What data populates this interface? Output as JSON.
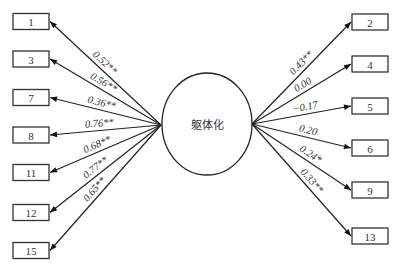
{
  "diagram": {
    "type": "path-diagram",
    "latent": {
      "id": "latent",
      "label": "躯体化"
    },
    "left_items": [
      {
        "id": "1",
        "label": "1",
        "coefficient": "0.52**"
      },
      {
        "id": "3",
        "label": "3",
        "coefficient": "0.56**"
      },
      {
        "id": "7",
        "label": "7",
        "coefficient": "0.36**"
      },
      {
        "id": "8",
        "label": "8",
        "coefficient": "0.76**"
      },
      {
        "id": "11",
        "label": "11",
        "coefficient": "0.68**"
      },
      {
        "id": "12",
        "label": "12",
        "coefficient": "0.77**"
      },
      {
        "id": "15",
        "label": "15",
        "coefficient": "0.65**"
      }
    ],
    "right_items": [
      {
        "id": "2",
        "label": "2",
        "coefficient": "0.43**"
      },
      {
        "id": "4",
        "label": "4",
        "coefficient": "0.00"
      },
      {
        "id": "5",
        "label": "5",
        "coefficient": "−0.17"
      },
      {
        "id": "6",
        "label": "6",
        "coefficient": "0.20"
      },
      {
        "id": "9",
        "label": "9",
        "coefficient": "0.24*"
      },
      {
        "id": "13",
        "label": "13",
        "coefficient": "0.33**"
      }
    ],
    "edge_direction": "latent-to-item"
  }
}
